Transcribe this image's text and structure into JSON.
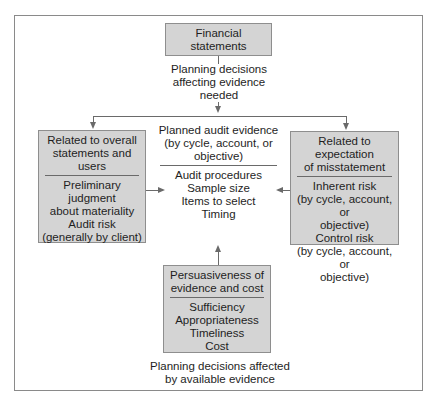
{
  "diagram": {
    "top_box": {
      "lines": [
        "Financial",
        "statements"
      ]
    },
    "top_caption": {
      "lines": [
        "Planning decisions",
        "affecting evidence",
        "needed"
      ]
    },
    "left_box": {
      "header": [
        "Related to overall",
        "statements and users"
      ],
      "body": [
        "Preliminary judgment",
        "about materiality",
        "Audit risk",
        "(generally by client)"
      ]
    },
    "center": {
      "header": [
        "Planned audit evidence",
        "(by cycle, account, or",
        "objective)"
      ],
      "body": [
        "Audit procedures",
        "Sample size",
        "Items to select",
        "Timing"
      ]
    },
    "right_box": {
      "header": [
        "Related to expectation",
        "of misstatement"
      ],
      "body": [
        "Inherent risk",
        "(by cycle, account, or",
        "objective)",
        "Control risk",
        "(by cycle, account, or",
        "objective)"
      ]
    },
    "bottom_box": {
      "header": [
        "Persuasiveness of",
        "evidence and cost"
      ],
      "body": [
        "Sufficiency",
        "Appropriateness",
        "Timeliness",
        "Cost"
      ]
    },
    "bottom_caption": {
      "lines": [
        "Planning decisions affected",
        "by available evidence"
      ]
    },
    "colors": {
      "box_fill": "#d4d4d4",
      "box_border": "#8e8e8e",
      "line": "#6a6a6a",
      "frame": "#8a8a8a"
    }
  }
}
